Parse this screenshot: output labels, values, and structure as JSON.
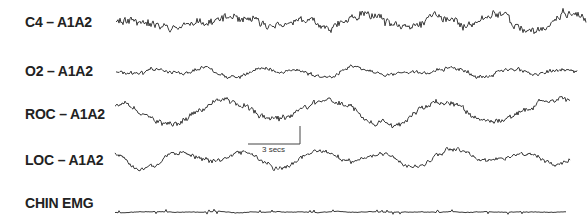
{
  "chart_data": {
    "type": "line",
    "title": "",
    "xlabel": "",
    "ylabel": "",
    "grid": false,
    "legend": "none",
    "scale_bar": {
      "label": "3 secs",
      "x0": 248,
      "x1": 300,
      "y": 144,
      "tick_top": 126
    },
    "series": [
      {
        "name": "C4 – A1A2",
        "label_y": 14,
        "baseline": 22,
        "x_start": 116,
        "x_end": 586,
        "amplitude": 11,
        "freq": 0.55,
        "noise": 0.45,
        "seed": 11
      },
      {
        "name": "O2 – A1A2",
        "label_y": 63,
        "baseline": 72,
        "x_start": 116,
        "x_end": 577,
        "amplitude": 5,
        "freq": 0.75,
        "noise": 0.5,
        "seed": 23
      },
      {
        "name": "ROC – A1A2",
        "label_y": 108,
        "baseline": 112,
        "x_start": 115,
        "x_end": 570,
        "amplitude": 9,
        "freq": 0.4,
        "noise": 0.35,
        "seed": 37
      },
      {
        "name": "LOC – A1A2",
        "label_y": 155,
        "baseline": 158,
        "x_start": 115,
        "x_end": 570,
        "amplitude": 7,
        "freq": 0.45,
        "noise": 0.35,
        "seed": 51
      },
      {
        "name": "CHIN EMG",
        "label_y": 197,
        "baseline": 212,
        "x_start": 115,
        "x_end": 566,
        "amplitude": 0.7,
        "freq": 2.0,
        "noise": 0.6,
        "seed": 67
      }
    ]
  }
}
